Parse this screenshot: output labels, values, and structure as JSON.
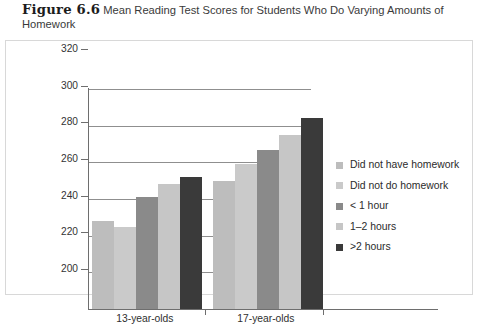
{
  "caption": {
    "figure_number": "Figure 6.6",
    "text": "Mean Reading Test Scores for Students Who Do Varying Amounts of Homework"
  },
  "chart_data": {
    "type": "bar",
    "title": "Mean Reading Test Scores for Students Who Do Varying Amounts of Homework",
    "xlabel": "",
    "ylabel": "Reading Test Score",
    "categories": [
      "13-year-olds",
      "17-year-olds"
    ],
    "series": [
      {
        "name": "Did not have homework",
        "values": [
          248,
          270
        ],
        "color": "#bdbdbd"
      },
      {
        "name": "Did not do homework",
        "values": [
          245,
          279
        ],
        "color": "#cacaca"
      },
      {
        "name": "< 1 hour",
        "values": [
          261,
          287
        ],
        "color": "#8a8a8a"
      },
      {
        "name": "1–2 hours",
        "values": [
          268,
          295
        ],
        "color": "#c6c6c6"
      },
      {
        "name": ">2 hours",
        "values": [
          272,
          304
        ],
        "color": "#3a3a3a"
      }
    ],
    "ylim": [
      200,
      320
    ],
    "yticks": [
      200,
      220,
      240,
      260,
      280,
      300,
      320
    ],
    "ytick_labels": [
      "200",
      "220",
      "240",
      "260",
      "280",
      "300",
      "320"
    ],
    "grid": true,
    "legend_position": "right"
  },
  "legend": {
    "items": [
      {
        "label": "Did not have homework",
        "color": "#bdbdbd"
      },
      {
        "label": "Did not do homework",
        "color": "#cacaca"
      },
      {
        "label": "< 1 hour",
        "color": "#8a8a8a"
      },
      {
        "label": "1–2 hours",
        "color": "#c6c6c6"
      },
      {
        "label": ">2 hours",
        "color": "#3a3a3a"
      }
    ]
  }
}
